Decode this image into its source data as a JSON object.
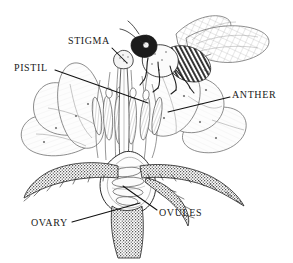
{
  "figure": {
    "kind": "botanical-illustration",
    "style": "black-and-white pen-and-ink line drawing with stipple shading",
    "background_color": "#ffffff",
    "ink_color": "#1a1a1a",
    "width": 293,
    "height": 263
  },
  "labels": {
    "stigma": "STIGMA",
    "pistil": "PISTIL",
    "anther": "ANTHER",
    "ovules": "OVULES",
    "ovary": "OVARY"
  },
  "leader_lines": [
    {
      "label": "STIGMA",
      "from": [
        112,
        48
      ],
      "to": [
        126,
        62
      ]
    },
    {
      "label": "PISTIL",
      "from": [
        55,
        70
      ],
      "to": [
        148,
        103
      ]
    },
    {
      "label": "ANTHER",
      "from": [
        230,
        97
      ],
      "to": [
        168,
        112
      ]
    },
    {
      "label": "OVULES",
      "from": [
        157,
        210
      ],
      "to": [
        123,
        186
      ]
    },
    {
      "label": "OVARY",
      "from": [
        72,
        222
      ],
      "to": [
        140,
        203
      ]
    }
  ],
  "parts": [
    {
      "name": "bee",
      "description": "honeybee with dark head, striped abdomen, two pairs of veined wings and six legs, perched at upper right of the flower"
    },
    {
      "name": "stigma",
      "description": "small knob at the apex of the style"
    },
    {
      "name": "style",
      "description": "long slender stalk rising from the ovary to the stigma"
    },
    {
      "name": "anthers",
      "description": "cluster of elongate pollen sacs on filaments flanking the style"
    },
    {
      "name": "petals",
      "description": "broad pale petals spreading left and right, drawn in fine outline with line shading"
    },
    {
      "name": "ovary",
      "description": "teardrop-shaped chamber at the base of the pistil, shown cut open"
    },
    {
      "name": "ovules",
      "description": "small oval bodies arranged inside the ovary chamber"
    },
    {
      "name": "sepals",
      "description": "dark heavily stippled hairy sepals curving outward below the petals"
    },
    {
      "name": "stem",
      "description": "stippled tapering stalk descending from the receptacle"
    }
  ]
}
